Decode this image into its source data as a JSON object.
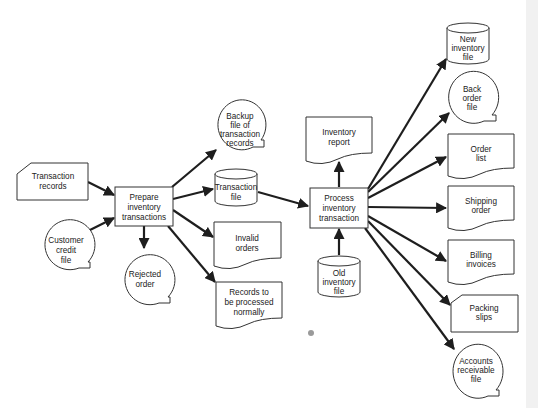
{
  "diagram": {
    "type": "system-flowchart",
    "colors": {
      "line": "#1e1e1e",
      "shape_fill": "#ffffff",
      "text": "#222222",
      "background": "#ffffff"
    },
    "nodes": {
      "transaction_records": {
        "shape": "punched-card",
        "lines": [
          "Transaction",
          "records"
        ]
      },
      "customer_credit_file": {
        "shape": "online-storage",
        "lines": [
          "Customer",
          "credit",
          "file"
        ]
      },
      "prepare": {
        "shape": "process",
        "lines": [
          "Prepare",
          "inventory",
          "transactions"
        ]
      },
      "rejected_order": {
        "shape": "online-storage",
        "lines": [
          "Rejected",
          "order"
        ]
      },
      "backup_file": {
        "shape": "online-storage",
        "lines": [
          "Backup",
          "file of",
          "transaction",
          "records"
        ]
      },
      "transaction_file": {
        "shape": "disk",
        "lines": [
          "Transaction",
          "file"
        ]
      },
      "invalid_orders": {
        "shape": "document",
        "lines": [
          "Invalid",
          "orders"
        ]
      },
      "records_to_process": {
        "shape": "document",
        "lines": [
          "Records to",
          "be processed",
          "normally"
        ]
      },
      "inventory_report": {
        "shape": "document",
        "lines": [
          "Inventory",
          "report"
        ]
      },
      "process": {
        "shape": "process",
        "lines": [
          "Process",
          "inventory",
          "transaction"
        ]
      },
      "old_inventory_file": {
        "shape": "disk",
        "lines": [
          "Old",
          "inventory",
          "file"
        ]
      },
      "new_inventory_file": {
        "shape": "disk",
        "lines": [
          "New",
          "inventory",
          "file"
        ]
      },
      "back_order_file": {
        "shape": "online-storage",
        "lines": [
          "Back",
          "order",
          "file"
        ]
      },
      "order_list": {
        "shape": "document",
        "lines": [
          "Order",
          "list"
        ]
      },
      "shipping_order": {
        "shape": "document",
        "lines": [
          "Shipping",
          "order"
        ]
      },
      "billing_invoices": {
        "shape": "document",
        "lines": [
          "Billing",
          "invoices"
        ]
      },
      "packing_slips": {
        "shape": "punched-card",
        "lines": [
          "Packing",
          "slips"
        ]
      },
      "accounts_receivable_file": {
        "shape": "online-storage",
        "lines": [
          "Accounts",
          "receivable",
          "file"
        ]
      }
    },
    "edges": [
      [
        "transaction_records",
        "prepare"
      ],
      [
        "customer_credit_file",
        "prepare"
      ],
      [
        "prepare",
        "rejected_order"
      ],
      [
        "prepare",
        "backup_file"
      ],
      [
        "prepare",
        "transaction_file"
      ],
      [
        "prepare",
        "invalid_orders"
      ],
      [
        "prepare",
        "records_to_process"
      ],
      [
        "transaction_file",
        "process"
      ],
      [
        "process",
        "inventory_report"
      ],
      [
        "old_inventory_file",
        "process"
      ],
      [
        "process",
        "new_inventory_file"
      ],
      [
        "process",
        "back_order_file"
      ],
      [
        "process",
        "order_list"
      ],
      [
        "process",
        "shipping_order"
      ],
      [
        "process",
        "billing_invoices"
      ],
      [
        "process",
        "packing_slips"
      ],
      [
        "process",
        "accounts_receivable_file"
      ]
    ]
  }
}
